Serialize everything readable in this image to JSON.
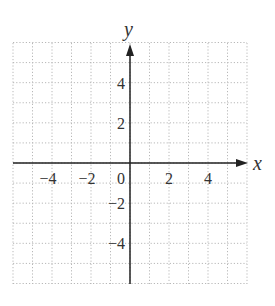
{
  "chart_data": {
    "type": "scatter",
    "title": "",
    "xlabel": "x",
    "ylabel": "y",
    "xlim": [
      -6,
      6
    ],
    "ylim": [
      -6,
      6
    ],
    "grid": true,
    "grid_style": "dotted",
    "grid_step": 1,
    "x_ticks": [
      -4,
      -2,
      0,
      2,
      4
    ],
    "y_ticks": [
      4,
      2,
      -2,
      -4
    ],
    "x_tick_labels": [
      "−4",
      "−2",
      "0",
      "2",
      "4"
    ],
    "y_tick_labels": [
      "4",
      "2",
      "−2",
      "−4"
    ],
    "series": [],
    "legend": null
  },
  "labels": {
    "x_axis": "x",
    "y_axis": "y"
  },
  "colors": {
    "axis": "#222222",
    "grid": "#b8b8b8",
    "text": "#333333"
  }
}
